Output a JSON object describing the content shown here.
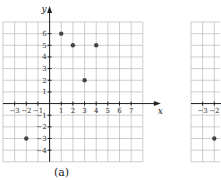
{
  "chart_data": [
    {
      "type": "scatter",
      "caption": "(a)",
      "xlabel": "x",
      "ylabel": "y",
      "xlim": [
        -4,
        8
      ],
      "ylim": [
        -5,
        7
      ],
      "grid": true,
      "xticks": [
        -3,
        -2,
        -1,
        1,
        2,
        3,
        4,
        5,
        6,
        7
      ],
      "xtick_labels": [
        "−3",
        "−2",
        "−1",
        "1",
        "2",
        "3",
        "4",
        "5",
        "6",
        "7"
      ],
      "yticks": [
        6,
        5,
        4,
        3,
        2,
        1,
        -1,
        -2,
        -3,
        -4
      ],
      "ytick_labels": [
        "6",
        "5",
        "4",
        "3",
        "2",
        "1",
        "−1",
        "−2",
        "−3",
        "−4"
      ],
      "points": [
        {
          "x": 1,
          "y": 6
        },
        {
          "x": 2,
          "y": 5
        },
        {
          "x": 4,
          "y": 5
        },
        {
          "x": 3,
          "y": 2
        },
        {
          "x": -2,
          "y": -3
        }
      ]
    },
    {
      "type": "scatter",
      "partial": true,
      "xlim": [
        -4,
        -1.5
      ],
      "ylim": [
        -5,
        7
      ],
      "grid": true,
      "xticks": [
        -3,
        -2
      ],
      "xtick_labels": [
        "−3",
        "−2"
      ],
      "points": [
        {
          "x": -2,
          "y": -3
        }
      ]
    }
  ]
}
